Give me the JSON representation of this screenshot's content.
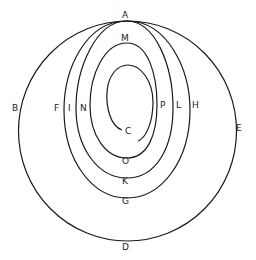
{
  "diagram": {
    "labels": {
      "A": "A",
      "B": "B",
      "C": "C",
      "D": "D",
      "E": "E",
      "F": "F",
      "G": "G",
      "H": "H",
      "I": "I",
      "K": "K",
      "L": "L",
      "M": "M",
      "N": "N",
      "O": "O",
      "P": "P"
    },
    "curves": [
      {
        "name": "outer-circle",
        "through": [
          "A",
          "B",
          "D",
          "E"
        ]
      },
      {
        "name": "oval-fgh",
        "through": [
          "A",
          "F",
          "G",
          "H"
        ]
      },
      {
        "name": "oval-ikl",
        "through": [
          "A",
          "I",
          "K",
          "L"
        ]
      },
      {
        "name": "spiral-inner",
        "through": [
          "M",
          "N",
          "O",
          "P",
          "C"
        ]
      }
    ],
    "stroke_color": "#1a1a1a"
  }
}
